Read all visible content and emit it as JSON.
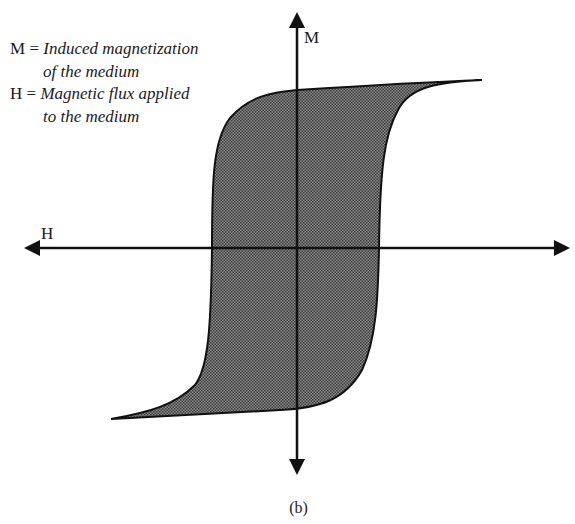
{
  "diagram": {
    "type": "hysteresis-loop",
    "caption": "(b)",
    "axes": {
      "vertical_label": "M",
      "horizontal_label": "H"
    },
    "legend": [
      {
        "symbol": "M",
        "separator": " = ",
        "description": "Induced magnetization",
        "continuation": "of the medium"
      },
      {
        "symbol": "H",
        "separator": " = ",
        "description": "Magnetic flux applied",
        "continuation": "to the medium"
      }
    ],
    "colors": {
      "line": "#111111",
      "fill": "#5a5a5a",
      "background": "#ffffff"
    }
  }
}
